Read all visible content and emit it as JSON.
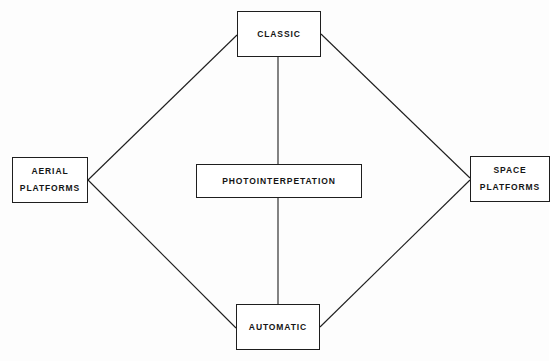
{
  "diagram": {
    "type": "relationship-diagram",
    "layout": "diamond",
    "nodes": [
      {
        "id": "classic",
        "lines": [
          "CLASSIC"
        ],
        "position": "top"
      },
      {
        "id": "aerial",
        "lines": [
          "AERIAL",
          "PLATFORMS"
        ],
        "position": "left"
      },
      {
        "id": "photo",
        "lines": [
          "PHOTOINTERPETATION"
        ],
        "position": "center"
      },
      {
        "id": "space",
        "lines": [
          "SPACE",
          "PLATFORMS"
        ],
        "position": "right"
      },
      {
        "id": "automatic",
        "lines": [
          "AUTOMATIC"
        ],
        "position": "bottom"
      }
    ],
    "edges": [
      {
        "from": "aerial",
        "to": "classic"
      },
      {
        "from": "aerial",
        "to": "automatic"
      },
      {
        "from": "classic",
        "to": "space"
      },
      {
        "from": "space",
        "to": "automatic"
      },
      {
        "from": "classic",
        "to": "photo"
      },
      {
        "from": "photo",
        "to": "automatic"
      }
    ],
    "colors": {
      "line": "#1e1e1e",
      "box_border": "#1e1e1e",
      "text": "#151515",
      "background": "#ffffff"
    }
  }
}
